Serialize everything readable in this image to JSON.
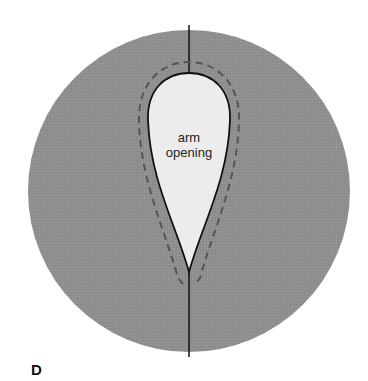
{
  "diagram": {
    "label": {
      "line1": "arm",
      "line2": "opening"
    },
    "panel_letter": "D",
    "colors": {
      "fabric": "#8f8f8f",
      "opening": "#ececec",
      "outline": "#111111",
      "dashed": "#555555"
    }
  }
}
